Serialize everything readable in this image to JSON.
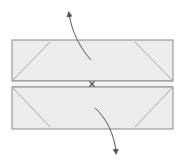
{
  "diagram": {
    "type": "origami-fold-step",
    "colors": {
      "background": "#ffffff",
      "paper_fill": "#ececec",
      "edge": "#8a8a8a",
      "crease": "#a8a8a8",
      "arrow": "#555555"
    },
    "paper": {
      "x": 12,
      "y": 40,
      "width": 161,
      "height": 89
    },
    "center_band": {
      "top": 81,
      "bottom": 87
    },
    "pivot_mark": {
      "x": 92,
      "y": 84,
      "glyph": "x"
    },
    "arrows": [
      {
        "name": "up",
        "direction": "up"
      },
      {
        "name": "down",
        "direction": "down"
      }
    ]
  }
}
